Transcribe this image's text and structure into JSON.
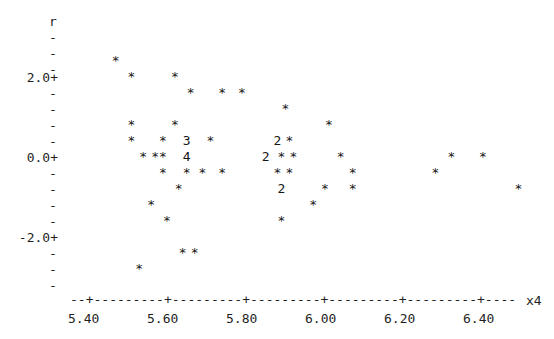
{
  "plot": {
    "type": "character-scatterplot",
    "y_axis_name": "r",
    "x_axis_name": "x4",
    "y_tick_labels": [
      "2.0+",
      "-",
      "-",
      "-",
      "-",
      "0.0+",
      "-",
      "-",
      "-",
      "-",
      "-2.0+",
      "-",
      "-",
      "-"
    ],
    "y_top_dashes": [
      "-",
      "-",
      "-"
    ],
    "x_axis_rule": "--+---------+---------+---------+---------+---------+----",
    "x_tick_labels": [
      "5.40",
      "5.60",
      "5.80",
      "6.00",
      "6.20",
      "6.40"
    ],
    "marker_symbol": "*",
    "colors": {
      "background": "#ffffff",
      "ink": "#1f1f1f"
    }
  },
  "chart_data": {
    "type": "scatter",
    "title": "",
    "xlabel": "x4",
    "ylabel": "r",
    "xlim": [
      5.32,
      6.52
    ],
    "ylim": [
      -3.0,
      3.0
    ],
    "grid": false,
    "legend": null,
    "marker_symbol": "*",
    "note": "Character-cell scatterplot (Minitab style). Digits (2,3,4) denote that many overlapping points in one cell.",
    "x_ticks": [
      5.4,
      5.6,
      5.8,
      6.0,
      6.2,
      6.4
    ],
    "y_ticks": [
      2.0,
      0.0,
      -2.0
    ],
    "points": [
      {
        "x": 5.47,
        "y": 2.4,
        "symbol": "*",
        "count": 1
      },
      {
        "x": 5.51,
        "y": 2.0,
        "symbol": "*",
        "count": 1
      },
      {
        "x": 5.62,
        "y": 2.0,
        "symbol": "*",
        "count": 1
      },
      {
        "x": 5.66,
        "y": 1.6,
        "symbol": "*",
        "count": 1
      },
      {
        "x": 5.74,
        "y": 1.6,
        "symbol": "*",
        "count": 1
      },
      {
        "x": 5.79,
        "y": 1.6,
        "symbol": "*",
        "count": 1
      },
      {
        "x": 5.9,
        "y": 1.2,
        "symbol": "*",
        "count": 1
      },
      {
        "x": 5.51,
        "y": 0.8,
        "symbol": "*",
        "count": 1
      },
      {
        "x": 5.62,
        "y": 0.8,
        "symbol": "*",
        "count": 1
      },
      {
        "x": 6.01,
        "y": 0.8,
        "symbol": "*",
        "count": 1
      },
      {
        "x": 5.51,
        "y": 0.4,
        "symbol": "*",
        "count": 1
      },
      {
        "x": 5.59,
        "y": 0.4,
        "symbol": "*",
        "count": 1
      },
      {
        "x": 5.65,
        "y": 0.4,
        "symbol": "3",
        "count": 3
      },
      {
        "x": 5.71,
        "y": 0.4,
        "symbol": "*",
        "count": 1
      },
      {
        "x": 5.88,
        "y": 0.4,
        "symbol": "2",
        "count": 2
      },
      {
        "x": 5.91,
        "y": 0.4,
        "symbol": "*",
        "count": 1
      },
      {
        "x": 5.54,
        "y": 0.0,
        "symbol": "*",
        "count": 1
      },
      {
        "x": 5.57,
        "y": 0.0,
        "symbol": "*",
        "count": 1
      },
      {
        "x": 5.59,
        "y": 0.0,
        "symbol": "*",
        "count": 1
      },
      {
        "x": 5.65,
        "y": 0.0,
        "symbol": "4",
        "count": 4
      },
      {
        "x": 5.85,
        "y": 0.0,
        "symbol": "2",
        "count": 2
      },
      {
        "x": 5.89,
        "y": 0.0,
        "symbol": "*",
        "count": 1
      },
      {
        "x": 5.92,
        "y": 0.0,
        "symbol": "*",
        "count": 1
      },
      {
        "x": 6.04,
        "y": 0.0,
        "symbol": "*",
        "count": 1
      },
      {
        "x": 6.32,
        "y": 0.0,
        "symbol": "*",
        "count": 1
      },
      {
        "x": 6.4,
        "y": 0.0,
        "symbol": "*",
        "count": 1
      },
      {
        "x": 5.59,
        "y": -0.4,
        "symbol": "*",
        "count": 1
      },
      {
        "x": 5.65,
        "y": -0.4,
        "symbol": "*",
        "count": 1
      },
      {
        "x": 5.69,
        "y": -0.4,
        "symbol": "*",
        "count": 1
      },
      {
        "x": 5.74,
        "y": -0.4,
        "symbol": "*",
        "count": 1
      },
      {
        "x": 5.88,
        "y": -0.4,
        "symbol": "*",
        "count": 1
      },
      {
        "x": 5.91,
        "y": -0.4,
        "symbol": "*",
        "count": 1
      },
      {
        "x": 6.07,
        "y": -0.4,
        "symbol": "*",
        "count": 1
      },
      {
        "x": 6.28,
        "y": -0.4,
        "symbol": "*",
        "count": 1
      },
      {
        "x": 5.63,
        "y": -0.8,
        "symbol": "*",
        "count": 1
      },
      {
        "x": 5.89,
        "y": -0.8,
        "symbol": "2",
        "count": 2
      },
      {
        "x": 6.0,
        "y": -0.8,
        "symbol": "*",
        "count": 1
      },
      {
        "x": 6.07,
        "y": -0.8,
        "symbol": "*",
        "count": 1
      },
      {
        "x": 6.49,
        "y": -0.8,
        "symbol": "*",
        "count": 1
      },
      {
        "x": 5.56,
        "y": -1.2,
        "symbol": "*",
        "count": 1
      },
      {
        "x": 5.97,
        "y": -1.2,
        "symbol": "*",
        "count": 1
      },
      {
        "x": 5.6,
        "y": -1.6,
        "symbol": "*",
        "count": 1
      },
      {
        "x": 5.89,
        "y": -1.6,
        "symbol": "*",
        "count": 1
      },
      {
        "x": 5.64,
        "y": -2.4,
        "symbol": "*",
        "count": 1
      },
      {
        "x": 5.67,
        "y": -2.4,
        "symbol": "*",
        "count": 1
      },
      {
        "x": 5.53,
        "y": -2.8,
        "symbol": "*",
        "count": 1
      }
    ]
  }
}
